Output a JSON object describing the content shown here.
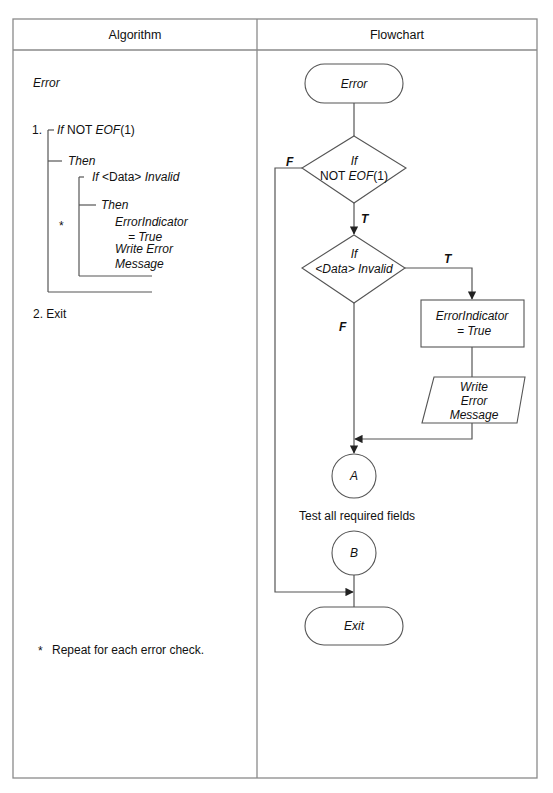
{
  "table": {
    "headers": [
      "Algorithm",
      "Flowchart"
    ]
  },
  "algorithm": {
    "title": "Error",
    "step1_number": "1.",
    "step1_if": "If",
    "step1_cond_plain": "NOT",
    "step1_cond_func": "EOF",
    "step1_cond_arg": "(1)",
    "then1": "Then",
    "inner_if": "If",
    "inner_cond_data": "<Data>",
    "inner_cond_state": "Invalid",
    "then2": "Then",
    "action_line1": "ErrorIndicator",
    "action_line2": "= True",
    "action_line3": "Write Error",
    "action_line4": "Message",
    "repeat_marker": "*",
    "step2": "2. Exit",
    "footnote_marker": "*",
    "footnote": "Repeat for each error check."
  },
  "flowchart": {
    "start_terminal": "Error",
    "decision1": {
      "line1": "If",
      "line2_plain": "NOT ",
      "line2_func": "EOF",
      "line2_arg": "(1)"
    },
    "decision1_false_label": "F",
    "decision1_true_label": "T",
    "decision2": {
      "line1": "If",
      "line2": "<Data> Invalid"
    },
    "decision2_true_label": "T",
    "decision2_false_label": "F",
    "process": {
      "line1": "ErrorIndicator",
      "line2": "= True"
    },
    "io": {
      "line1": "Write",
      "line2": "Error",
      "line3": "Message"
    },
    "connector_a": "A",
    "connector_note": "Test all required fields",
    "connector_b": "B",
    "end_terminal": "Exit"
  }
}
